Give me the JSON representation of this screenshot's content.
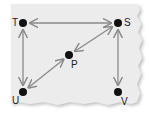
{
  "diagram": {
    "type": "directed-graph",
    "background": "#ececec",
    "edge_color": "#8a8a8a",
    "node_color": "#111111",
    "nodes": [
      {
        "id": "T",
        "label": "T",
        "x": 23,
        "y": 23,
        "label_x": 12,
        "label_y": 18
      },
      {
        "id": "S",
        "label": "S",
        "x": 118,
        "y": 23,
        "label_x": 124,
        "label_y": 18
      },
      {
        "id": "P",
        "label": "P",
        "x": 69,
        "y": 55,
        "label_x": 71,
        "label_y": 60
      },
      {
        "id": "U",
        "label": "U",
        "x": 23,
        "y": 92,
        "label_x": 12,
        "label_y": 96
      },
      {
        "id": "V",
        "label": "V",
        "x": 118,
        "y": 92,
        "label_x": 121,
        "label_y": 97
      }
    ],
    "edges": [
      {
        "from": "T",
        "to": "S",
        "bidirectional": true
      },
      {
        "from": "T",
        "to": "U",
        "bidirectional": true
      },
      {
        "from": "S",
        "to": "P",
        "bidirectional": true
      },
      {
        "from": "P",
        "to": "U",
        "bidirectional": true
      },
      {
        "from": "S",
        "to": "V",
        "bidirectional": true
      }
    ]
  }
}
